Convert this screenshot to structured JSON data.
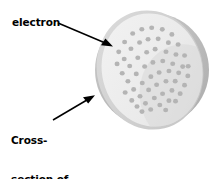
{
  "figure": {
    "background_color": "#ffffff"
  },
  "labels": {
    "electron": {
      "text": "electron",
      "name": "electron-label"
    },
    "cross_section": {
      "lines": [
        "Cross-",
        "section of",
        "positively",
        "charged",
        "sphere"
      ],
      "name": "cross-section-label"
    }
  },
  "annotations": {
    "arrow_electron": {
      "name": "arrow-to-electron",
      "from": [
        58,
        23
      ],
      "to": [
        112,
        46
      ],
      "color": "#000000"
    },
    "arrow_cross_section": {
      "name": "arrow-to-cross-section",
      "from": [
        53,
        120
      ],
      "to": [
        94,
        96
      ],
      "color": "#000000"
    }
  },
  "sphere": {
    "name": "positively-charged-sphere",
    "body_color": "#b5b5b5",
    "body_highlight_color": "#c9c9c9",
    "rim_color": "#d8d8d8",
    "face_color": "#ededed",
    "face_shadow_color": "#dcdcdc",
    "electron_color": "#b4b4b4",
    "electron_count": 58,
    "center": [
      152,
      70
    ],
    "radius_x": 56,
    "radius_y": 58,
    "face_rotation_deg": -14,
    "electrons": [
      [
        0.0,
        -0.82
      ],
      [
        0.22,
        -0.8
      ],
      [
        0.44,
        -0.72
      ],
      [
        -0.22,
        -0.78
      ],
      [
        -0.44,
        -0.66
      ],
      [
        0.62,
        -0.58
      ],
      [
        -0.62,
        -0.5
      ],
      [
        0.08,
        -0.6
      ],
      [
        0.3,
        -0.56
      ],
      [
        0.5,
        -0.44
      ],
      [
        -0.12,
        -0.58
      ],
      [
        -0.34,
        -0.5
      ],
      [
        -0.54,
        -0.34
      ],
      [
        0.7,
        -0.36
      ],
      [
        -0.72,
        -0.28
      ],
      [
        0.18,
        -0.38
      ],
      [
        0.4,
        -0.28
      ],
      [
        0.6,
        -0.18
      ],
      [
        -0.02,
        -0.36
      ],
      [
        -0.24,
        -0.3
      ],
      [
        -0.46,
        -0.18
      ],
      [
        -0.66,
        -0.08
      ],
      [
        0.78,
        -0.12
      ],
      [
        0.28,
        -0.12
      ],
      [
        0.48,
        -0.02
      ],
      [
        0.06,
        -0.14
      ],
      [
        -0.14,
        -0.1
      ],
      [
        -0.36,
        0.0
      ],
      [
        -0.58,
        0.1
      ],
      [
        0.68,
        0.08
      ],
      [
        0.8,
        0.1
      ],
      [
        0.36,
        0.1
      ],
      [
        0.56,
        0.18
      ],
      [
        0.14,
        0.08
      ],
      [
        -0.06,
        0.12
      ],
      [
        -0.28,
        0.2
      ],
      [
        -0.5,
        0.28
      ],
      [
        -0.7,
        0.3
      ],
      [
        0.74,
        0.28
      ],
      [
        0.24,
        0.28
      ],
      [
        0.44,
        0.32
      ],
      [
        0.02,
        0.3
      ],
      [
        -0.18,
        0.36
      ],
      [
        -0.4,
        0.44
      ],
      [
        -0.6,
        0.48
      ],
      [
        0.62,
        0.44
      ],
      [
        0.32,
        0.48
      ],
      [
        0.1,
        0.5
      ],
      [
        -0.1,
        0.54
      ],
      [
        -0.32,
        0.6
      ],
      [
        -0.52,
        0.62
      ],
      [
        0.48,
        0.58
      ],
      [
        0.2,
        0.66
      ],
      [
        -0.02,
        0.7
      ],
      [
        -0.24,
        0.74
      ],
      [
        -0.44,
        0.74
      ],
      [
        0.34,
        0.7
      ],
      [
        0.08,
        0.82
      ]
    ]
  }
}
